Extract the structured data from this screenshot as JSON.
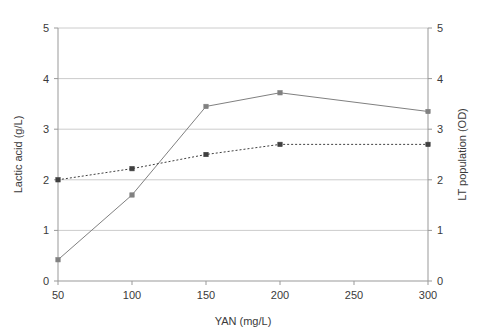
{
  "chart_data": {
    "type": "line",
    "title": "",
    "xlabel": "YAN (mg/L)",
    "ylabel": "Lactic acid (g/L)",
    "y2label": "LT population (OD)",
    "x": [
      50,
      100,
      150,
      200,
      300
    ],
    "xlim": [
      50,
      300
    ],
    "ylim": [
      0,
      5
    ],
    "y2lim": [
      0,
      5
    ],
    "xticks": [
      "50",
      "100",
      "150",
      "200",
      "250",
      "300"
    ],
    "xtick_values": [
      50,
      100,
      150,
      200,
      250,
      300
    ],
    "yticks": [
      "0",
      "1",
      "2",
      "3",
      "4",
      "5"
    ],
    "ytick_values": [
      0,
      1,
      2,
      3,
      4,
      5
    ],
    "y2ticks": [
      "0",
      "1",
      "2",
      "3",
      "4",
      "5"
    ],
    "y2tick_values": [
      0,
      1,
      2,
      3,
      4,
      5
    ],
    "grid": true,
    "grid_axis": "y",
    "legend": "none",
    "series": [
      {
        "name": "Lactic acid (g/L)",
        "axis": "left",
        "style": "solid",
        "marker": "square",
        "color": "#808080",
        "x": [
          50,
          100,
          150,
          200,
          300
        ],
        "values": [
          0.42,
          1.7,
          3.45,
          3.72,
          3.35
        ]
      },
      {
        "name": "LT population (OD)",
        "axis": "right",
        "style": "dotted",
        "marker": "square",
        "color": "#404040",
        "x": [
          50,
          100,
          150,
          200,
          300
        ],
        "values": [
          2.0,
          2.22,
          2.5,
          2.7,
          2.7
        ]
      }
    ],
    "colors": {
      "axis": "#999999",
      "grid": "#cccccc",
      "text": "#3a3a3a",
      "background": "#ffffff"
    }
  },
  "layout": {
    "plot_left": 58,
    "plot_right": 428,
    "plot_top": 28,
    "plot_bottom": 281
  }
}
